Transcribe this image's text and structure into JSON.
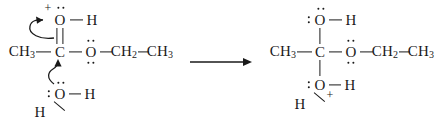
{
  "figure": {
    "type": "reaction-mechanism"
  },
  "reaction_arrow": {
    "symbol": "right-arrow",
    "x1": 190,
    "x2": 251,
    "y": 62
  },
  "reactant": {
    "label": "protonated-ester-with-water",
    "atoms": [
      {
        "id": "r-ch3-left",
        "text": "CH₃",
        "x": 22,
        "y": 52
      },
      {
        "id": "r-c-center",
        "text": "C",
        "x": 60,
        "y": 52
      },
      {
        "id": "r-o-top",
        "text": "O",
        "x": 60,
        "y": 20
      },
      {
        "id": "r-h-top",
        "text": "H",
        "x": 92,
        "y": 20
      },
      {
        "id": "r-o-ester",
        "text": "O",
        "x": 91,
        "y": 52
      },
      {
        "id": "r-ch2",
        "text": "CH₂",
        "x": 124,
        "y": 52
      },
      {
        "id": "r-ch3-right",
        "text": "CH₃",
        "x": 160,
        "y": 52
      },
      {
        "id": "r-o-water",
        "text": "O",
        "x": 60,
        "y": 94
      },
      {
        "id": "r-h-water-1",
        "text": "H",
        "x": 90,
        "y": 94
      },
      {
        "id": "r-h-water-2",
        "text": "H",
        "x": 40,
        "y": 112
      }
    ],
    "charges": [
      {
        "id": "r-plus-o-top",
        "text": "+",
        "x": 48,
        "y": 8
      }
    ],
    "lone_pairs": [
      {
        "id": "r-lp-otop-above",
        "x": 61,
        "y": 8,
        "orient": "horizontal"
      },
      {
        "id": "r-lp-oester-above",
        "x": 91,
        "y": 41,
        "orient": "horizontal"
      },
      {
        "id": "r-lp-oester-below",
        "x": 91,
        "y": 63,
        "orient": "horizontal"
      },
      {
        "id": "r-lp-owater-above",
        "x": 61,
        "y": 83,
        "orient": "horizontal"
      },
      {
        "id": "r-lp-owater-left",
        "x": 49,
        "y": 94,
        "orient": "vertical"
      }
    ],
    "curved_arrows": [
      {
        "id": "r-arrow-pi-to-o",
        "from": "C=O pi bond",
        "to": "O top"
      },
      {
        "id": "r-arrow-water-to-c",
        "from": "water O lone pair",
        "to": "C center"
      }
    ]
  },
  "product": {
    "label": "tetrahedral-intermediate",
    "atoms": [
      {
        "id": "p-ch3-left",
        "text": "CH₃",
        "x": 283,
        "y": 52
      },
      {
        "id": "p-c-center",
        "text": "C",
        "x": 320,
        "y": 52
      },
      {
        "id": "p-o-top",
        "text": "O",
        "x": 320,
        "y": 20
      },
      {
        "id": "p-h-top",
        "text": "H",
        "x": 351,
        "y": 20
      },
      {
        "id": "p-o-ester",
        "text": "O",
        "x": 351,
        "y": 52
      },
      {
        "id": "p-ch2",
        "text": "CH₂",
        "x": 385,
        "y": 52
      },
      {
        "id": "p-ch3-right",
        "text": "CH₃",
        "x": 421,
        "y": 52
      },
      {
        "id": "p-o-bottom",
        "text": "O",
        "x": 320,
        "y": 85
      },
      {
        "id": "p-h-bottom-1",
        "text": "H",
        "x": 350,
        "y": 85
      },
      {
        "id": "p-h-bottom-2",
        "text": "H",
        "x": 300,
        "y": 104
      }
    ],
    "charges": [
      {
        "id": "p-plus-o-bottom",
        "text": "+",
        "x": 330,
        "y": 95
      }
    ],
    "lone_pairs": [
      {
        "id": "p-lp-otop-above",
        "x": 321,
        "y": 9,
        "orient": "horizontal"
      },
      {
        "id": "p-lp-otop-left",
        "x": 309,
        "y": 20,
        "orient": "vertical"
      },
      {
        "id": "p-lp-oester-above",
        "x": 351,
        "y": 41,
        "orient": "horizontal"
      },
      {
        "id": "p-lp-oester-below",
        "x": 351,
        "y": 63,
        "orient": "horizontal"
      },
      {
        "id": "p-lp-obottom-left",
        "x": 309,
        "y": 85,
        "orient": "vertical"
      }
    ]
  }
}
